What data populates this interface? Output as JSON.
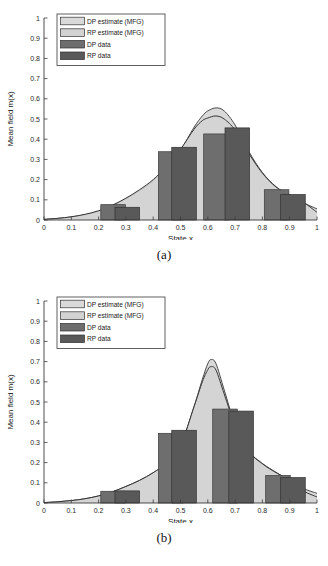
{
  "figure": {
    "panels": [
      {
        "caption": "(a)",
        "chart_data": {
          "type": "bar",
          "title": "",
          "xlabel": "State x",
          "ylabel": "Mean field m(x)",
          "xlim": [
            0,
            1
          ],
          "ylim": [
            0,
            1
          ],
          "xticks": [
            "0",
            "0.1",
            "0.2",
            "0.3",
            "0.4",
            "0.5",
            "0.6",
            "0.7",
            "0.8",
            "0.9",
            "1"
          ],
          "xtick_values": [
            0,
            0.1,
            0.2,
            0.3,
            0.4,
            0.5,
            0.6,
            0.7,
            0.8,
            0.9,
            1
          ],
          "yticks": [
            "0",
            "0.1",
            "0.2",
            "0.3",
            "0.4",
            "0.5",
            "0.6",
            "0.7",
            "0.8",
            "0.9",
            "1"
          ],
          "ytick_values": [
            0,
            0.1,
            0.2,
            0.3,
            0.4,
            0.5,
            0.6,
            0.7,
            0.8,
            0.9,
            1
          ],
          "grid": false,
          "legend_position": "upper-left",
          "legend": [
            "DP estimate (MFG)",
            "RP estimate (MFG)",
            "DP data",
            "RP data"
          ],
          "series": [
            {
              "name": "DP estimate (MFG)",
              "kind": "area-curve",
              "color": "#d9d9d9",
              "edge": "#404040",
              "peak_x": 0.63,
              "peak_y": 0.555,
              "x": [
                0.0,
                0.05,
                0.1,
                0.15,
                0.2,
                0.25,
                0.3,
                0.35,
                0.4,
                0.45,
                0.5,
                0.55,
                0.58,
                0.6,
                0.63,
                0.66,
                0.7,
                0.75,
                0.8,
                0.85,
                0.9,
                0.95,
                1.0
              ],
              "y": [
                0.003,
                0.008,
                0.015,
                0.026,
                0.043,
                0.07,
                0.105,
                0.145,
                0.195,
                0.262,
                0.345,
                0.46,
                0.515,
                0.54,
                0.555,
                0.54,
                0.47,
                0.34,
                0.235,
                0.165,
                0.12,
                0.085,
                0.055
              ]
            },
            {
              "name": "RP estimate (MFG)",
              "kind": "area-curve",
              "color": "#d2d2d2",
              "edge": "#2f2f2f",
              "peak_x": 0.63,
              "peak_y": 0.515,
              "x": [
                0.0,
                0.05,
                0.1,
                0.15,
                0.2,
                0.25,
                0.3,
                0.35,
                0.4,
                0.45,
                0.5,
                0.55,
                0.58,
                0.6,
                0.63,
                0.66,
                0.7,
                0.75,
                0.8,
                0.85,
                0.9,
                0.95,
                1.0
              ],
              "y": [
                0.003,
                0.008,
                0.016,
                0.028,
                0.046,
                0.073,
                0.108,
                0.15,
                0.2,
                0.268,
                0.35,
                0.45,
                0.492,
                0.505,
                0.515,
                0.5,
                0.445,
                0.33,
                0.232,
                0.163,
                0.125,
                0.088,
                0.038
              ]
            },
            {
              "name": "DP data",
              "kind": "bar",
              "color": "#6e6e6e",
              "edge": "#3a3a3a",
              "bar_width": 0.045,
              "x": [
                0.253,
                0.464,
                0.63,
                0.852
              ],
              "y": [
                0.076,
                0.338,
                0.426,
                0.15
              ]
            },
            {
              "name": "RP data",
              "kind": "bar",
              "color": "#595959",
              "edge": "#303030",
              "bar_width": 0.045,
              "x": [
                0.305,
                0.513,
                0.708,
                0.912
              ],
              "y": [
                0.063,
                0.36,
                0.456,
                0.126
              ]
            }
          ]
        }
      },
      {
        "caption": "(b)",
        "chart_data": {
          "type": "bar",
          "title": "",
          "xlabel": "State x",
          "ylabel": "Mean field m(x)",
          "xlim": [
            0,
            1
          ],
          "ylim": [
            0,
            1
          ],
          "xticks": [
            "0",
            "0.1",
            "0.2",
            "0.3",
            "0.4",
            "0.5",
            "0.6",
            "0.7",
            "0.8",
            "0.9",
            "1"
          ],
          "xtick_values": [
            0,
            0.1,
            0.2,
            0.3,
            0.4,
            0.5,
            0.6,
            0.7,
            0.8,
            0.9,
            1
          ],
          "yticks": [
            "0",
            "0.1",
            "0.2",
            "0.3",
            "0.4",
            "0.5",
            "0.6",
            "0.7",
            "0.8",
            "0.9",
            "1"
          ],
          "ytick_values": [
            0,
            0.1,
            0.2,
            0.3,
            0.4,
            0.5,
            0.6,
            0.7,
            0.8,
            0.9,
            1
          ],
          "grid": false,
          "legend_position": "upper-left",
          "legend": [
            "DP estimate (MFG)",
            "RP estimate (MFG)",
            "DP data",
            "RP data"
          ],
          "series": [
            {
              "name": "DP estimate (MFG)",
              "kind": "area-curve",
              "color": "#d9d9d9",
              "edge": "#404040",
              "peak_x": 0.612,
              "peak_y": 0.71,
              "x": [
                0.0,
                0.05,
                0.1,
                0.15,
                0.2,
                0.25,
                0.3,
                0.35,
                0.4,
                0.45,
                0.5,
                0.55,
                0.58,
                0.6,
                0.612,
                0.63,
                0.66,
                0.7,
                0.75,
                0.8,
                0.85,
                0.9,
                0.95,
                1.0
              ],
              "y": [
                0.002,
                0.006,
                0.012,
                0.021,
                0.035,
                0.055,
                0.082,
                0.112,
                0.15,
                0.2,
                0.285,
                0.48,
                0.612,
                0.69,
                0.71,
                0.69,
                0.56,
                0.39,
                0.258,
                0.196,
                0.152,
                0.11,
                0.072,
                0.048
              ]
            },
            {
              "name": "RP estimate (MFG)",
              "kind": "area-curve",
              "color": "#d2d2d2",
              "edge": "#2f2f2f",
              "peak_x": 0.612,
              "peak_y": 0.675,
              "x": [
                0.0,
                0.05,
                0.1,
                0.15,
                0.2,
                0.25,
                0.3,
                0.35,
                0.4,
                0.45,
                0.5,
                0.55,
                0.58,
                0.6,
                0.612,
                0.63,
                0.66,
                0.7,
                0.75,
                0.8,
                0.85,
                0.9,
                0.95,
                1.0
              ],
              "y": [
                0.002,
                0.006,
                0.012,
                0.021,
                0.035,
                0.055,
                0.082,
                0.112,
                0.15,
                0.2,
                0.285,
                0.478,
                0.6,
                0.66,
                0.675,
                0.658,
                0.54,
                0.385,
                0.256,
                0.194,
                0.15,
                0.112,
                0.06,
                0.03
              ]
            },
            {
              "name": "DP data",
              "kind": "bar",
              "color": "#6e6e6e",
              "edge": "#3a3a3a",
              "bar_width": 0.045,
              "x": [
                0.253,
                0.464,
                0.663,
                0.857
              ],
              "y": [
                0.058,
                0.345,
                0.465,
                0.136
              ]
            },
            {
              "name": "RP data",
              "kind": "bar",
              "color": "#595959",
              "edge": "#303030",
              "bar_width": 0.045,
              "x": [
                0.305,
                0.513,
                0.722,
                0.912
              ],
              "y": [
                0.06,
                0.36,
                0.455,
                0.126
              ]
            }
          ]
        }
      }
    ]
  }
}
